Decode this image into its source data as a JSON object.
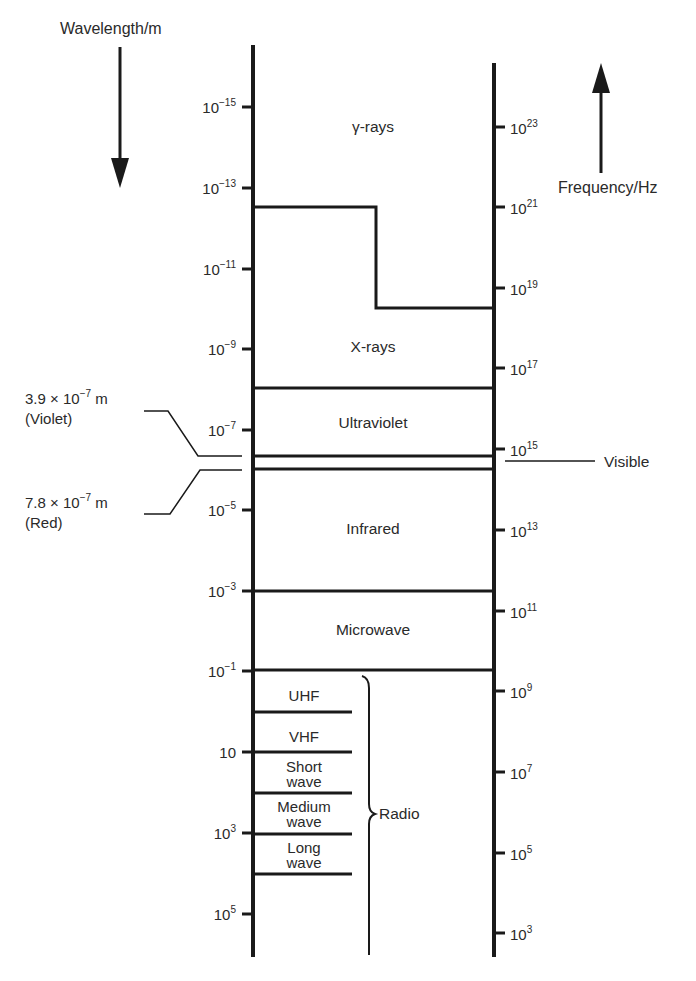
{
  "axes": {
    "wavelength": {
      "label": "Wavelength/m",
      "direction": "down",
      "ticks": [
        {
          "base": "10",
          "exp": "−15",
          "y": 107
        },
        {
          "base": "10",
          "exp": "−13",
          "y": 188
        },
        {
          "base": "10",
          "exp": "−11",
          "y": 269
        },
        {
          "base": "10",
          "exp": "−9",
          "y": 349
        },
        {
          "base": "10",
          "exp": "−7",
          "y": 430
        },
        {
          "base": "10",
          "exp": "−5",
          "y": 510
        },
        {
          "base": "10",
          "exp": "−3",
          "y": 591
        },
        {
          "base": "10",
          "exp": "−1",
          "y": 671
        },
        {
          "base": "10",
          "exp": "",
          "y": 752
        },
        {
          "base": "10",
          "exp": "3",
          "y": 833
        },
        {
          "base": "10",
          "exp": "5",
          "y": 914
        }
      ]
    },
    "frequency": {
      "label": "Frequency/Hz",
      "direction": "up",
      "ticks": [
        {
          "base": "10",
          "exp": "23",
          "y": 127
        },
        {
          "base": "10",
          "exp": "21",
          "y": 207
        },
        {
          "base": "10",
          "exp": "19",
          "y": 288
        },
        {
          "base": "10",
          "exp": "17",
          "y": 368
        },
        {
          "base": "10",
          "exp": "15",
          "y": 449
        },
        {
          "base": "10",
          "exp": "13",
          "y": 530
        },
        {
          "base": "10",
          "exp": "11",
          "y": 611
        },
        {
          "base": "10",
          "exp": "9",
          "y": 691
        },
        {
          "base": "10",
          "exp": "7",
          "y": 772
        },
        {
          "base": "10",
          "exp": "5",
          "y": 853
        },
        {
          "base": "10",
          "exp": "3",
          "y": 933
        }
      ]
    }
  },
  "bands": [
    {
      "name": "γ-rays",
      "label_y": 132
    },
    {
      "name": "X-rays",
      "label_y": 352
    },
    {
      "name": "Ultraviolet",
      "label_y": 428
    },
    {
      "name": "Infrared",
      "label_y": 534
    },
    {
      "name": "Microwave",
      "label_y": 635
    }
  ],
  "radio": {
    "label": "Radio",
    "sub_bands": [
      {
        "lines": [
          "UHF"
        ],
        "y": 696
      },
      {
        "lines": [
          "VHF"
        ],
        "y": 737
      },
      {
        "lines": [
          "Short",
          "wave"
        ],
        "y": 771
      },
      {
        "lines": [
          "Medium",
          "wave"
        ],
        "y": 811
      },
      {
        "lines": [
          "Long",
          "wave"
        ],
        "y": 852
      }
    ]
  },
  "visible": {
    "label": "Visible",
    "violet": {
      "value": "3.9 × 10",
      "exp": "−7",
      "unit": " m",
      "color_name": "(Violet)"
    },
    "red": {
      "value": "7.8 × 10",
      "exp": "−7",
      "unit": " m",
      "color_name": "(Red)"
    }
  },
  "colors": {
    "ink": "#1a1a1a",
    "text": "#2a2a2a",
    "background": "#ffffff"
  }
}
